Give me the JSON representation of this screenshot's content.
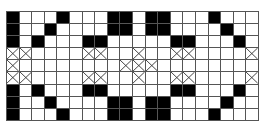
{
  "grid": {
    "columns": 20,
    "rows": 9,
    "colors": {
      "filled": "#000000",
      "empty": "#ffffff",
      "line": "#555555",
      "cross": "#333333"
    },
    "legend": {
      "B": "filled-black-cell",
      "X": "crossed-cell",
      ".": "empty-cell"
    },
    "cells": [
      "B...B...BB.BB...B...",
      "B..B....BB.BB....B..",
      "B.B...BB.....BB...B.",
      "XX....XX..X..XX....X",
      "X........XXX........",
      "XX....XX..X..XX....X",
      "B.B...BB.....BB...B.",
      "B..B....BB.BB....B..",
      "B...B...BB.BB...B..."
    ]
  }
}
